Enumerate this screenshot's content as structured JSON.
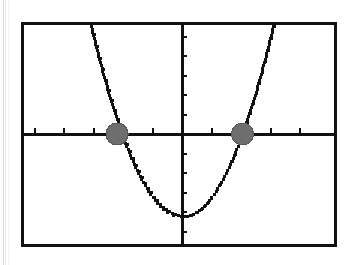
{
  "screen": {
    "device": "graphing-calculator",
    "title": "Graphing calculator screen",
    "frame": {
      "left": 21,
      "top": 22,
      "width": 316,
      "height": 225,
      "border_color": "#111111",
      "border_width": 3,
      "background_color": "#ffffff"
    }
  },
  "colors": {
    "axis": "#111111",
    "curve": "#111111",
    "marker_fill": "#6e6e6e",
    "marker_stroke": "#5a5a5a",
    "frame": "#111111",
    "background": "#ffffff",
    "scan_artifact": "#e4e4e4"
  },
  "chart_data": {
    "type": "line",
    "title": "",
    "subtitle": "",
    "xlabel": "",
    "ylabel": "",
    "grid": false,
    "legend": "none",
    "axis_style": "crosshair-with-ticks",
    "equation": "y = x^2 - 4",
    "xlim": [
      -5.9,
      4.9
    ],
    "ylim": [
      -5.6,
      5.6
    ],
    "x_tick_interval": 1,
    "y_tick_interval": 1,
    "x_ticks": [
      -5,
      -4,
      -3,
      -2,
      -1,
      1,
      2,
      3,
      4
    ],
    "y_ticks": [
      -5,
      -4,
      -3,
      -2,
      -1,
      1,
      2,
      3,
      4,
      5
    ],
    "tick_labels_shown": false,
    "curve_style": "dotted-pixel-trace",
    "vertex": {
      "x": 0,
      "y": -4.2
    },
    "series": [
      {
        "name": "y = x^2 - 4",
        "x": [
          -2.8,
          -2.6,
          -2.4,
          -2.2,
          -2.0,
          -1.8,
          -1.6,
          -1.4,
          -1.2,
          -1.0,
          -0.8,
          -0.6,
          -0.4,
          -0.2,
          0.0,
          0.2,
          0.4,
          0.6,
          0.8,
          1.0,
          1.2,
          1.4,
          1.6,
          1.8,
          2.0,
          2.2,
          2.4,
          2.6,
          2.8,
          3.0,
          3.2
        ],
        "values": [
          3.84,
          2.76,
          1.76,
          0.84,
          0.0,
          -0.76,
          -1.44,
          -2.04,
          -2.56,
          -3.0,
          -3.36,
          -3.64,
          -3.84,
          -3.96,
          -4.0,
          -3.96,
          -3.84,
          -3.64,
          -3.36,
          -3.0,
          -2.56,
          -2.04,
          -1.44,
          -0.76,
          0.0,
          0.84,
          1.76,
          2.76,
          3.84,
          5.0,
          6.24
        ]
      }
    ],
    "markers": [
      {
        "name": "left-root",
        "label": "",
        "x": -2.2,
        "y": 0,
        "radius_px": 11,
        "fill": "#6e6e6e"
      },
      {
        "name": "right-root",
        "label": "",
        "x": 2.05,
        "y": 0,
        "radius_px": 11,
        "fill": "#6e6e6e"
      }
    ],
    "annotations": []
  },
  "geometry": {
    "origin_px": {
      "x": 158,
      "y": 109
    },
    "x_unit_px": 29.5,
    "y_unit_px": 19.5,
    "x_axis_thickness": 3,
    "y_axis_thickness": 3,
    "tick_length_px": 6,
    "curve_dot_size_px": 3
  }
}
